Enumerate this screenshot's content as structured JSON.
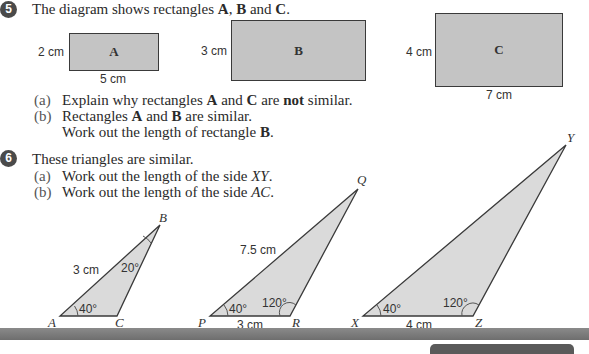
{
  "question5": {
    "number": "5",
    "stem_pre": "The diagram shows rectangles ",
    "stem_A": "A",
    "stem_sep1": ", ",
    "stem_B": "B",
    "stem_and": " and ",
    "stem_C": "C",
    "stem_end": ".",
    "rectangles": [
      {
        "label": "A",
        "height": "2 cm",
        "width": "5 cm"
      },
      {
        "label": "B",
        "height": "3 cm",
        "width": ""
      },
      {
        "label": "C",
        "height": "4 cm",
        "width": "7 cm"
      }
    ],
    "parts": [
      {
        "label": "(a)",
        "t1": "Explain why rectangles ",
        "b1": "A",
        "t2": " and ",
        "b2": "C",
        "t3": " are ",
        "b3": "not",
        "t4": " similar."
      },
      {
        "label": "(b)",
        "t1": "Rectangles ",
        "b1": "A",
        "t2": " and ",
        "b2": "B",
        "t3": " are similar.",
        "line2": "Work out the length of rectangle ",
        "line2_b": "B",
        "line2_end": "."
      }
    ]
  },
  "question6": {
    "number": "6",
    "stem": "These triangles are similar.",
    "parts": [
      {
        "label": "(a)",
        "text": "Work out the length of the side ",
        "var": "XY",
        "end": "."
      },
      {
        "label": "(b)",
        "text": "Work out the length of the side ",
        "var": "AC",
        "end": "."
      }
    ],
    "triangles": [
      {
        "vertices": [
          "A",
          "B",
          "C"
        ],
        "side_AB": "3 cm",
        "angle_A": "40°",
        "angle_B": "20°"
      },
      {
        "vertices": [
          "P",
          "Q",
          "R"
        ],
        "side_PQ": "7.5 cm",
        "side_PR": "3 cm",
        "angle_P": "40°",
        "angle_R": "120°"
      },
      {
        "vertices": [
          "X",
          "Y",
          "Z"
        ],
        "side_XZ": "4 cm",
        "angle_X": "40°",
        "angle_Z": "120°"
      }
    ]
  },
  "colors": {
    "shape_fill": "#c4c4c4",
    "triangle_fill": "#dadada",
    "outline": "#3a3a3a",
    "band": "#7a7a7a"
  }
}
